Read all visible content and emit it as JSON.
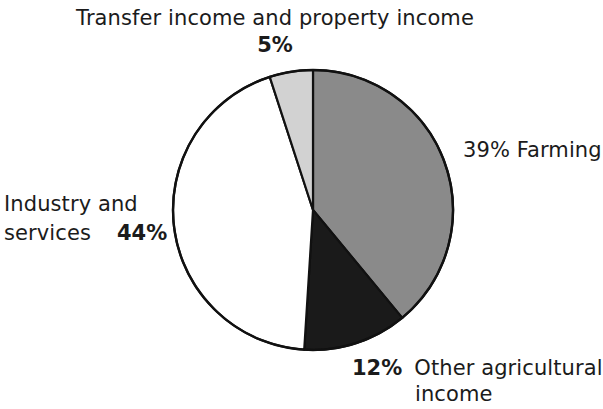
{
  "chart_data": {
    "type": "pie",
    "title": "",
    "categories": [
      "Farming",
      "Other agricultural income",
      "Industry and services",
      "Transfer income and property income"
    ],
    "values": [
      39,
      12,
      44,
      5
    ],
    "value_unit": "%",
    "legend": "none",
    "labels_position": "outside",
    "start_angle_deg": 0,
    "direction": "clockwise",
    "slices": [
      {
        "name": "Farming",
        "value": 39,
        "value_label": "39%",
        "label": "Farming",
        "full_label": "39% Farming",
        "color": "#8a8a8a",
        "start_deg": 0,
        "end_deg": 140.4
      },
      {
        "name": "Other agricultural income",
        "value": 12,
        "value_label": "12%",
        "label": "Other agricultural income",
        "full_label": "12% Other agricultural income",
        "color": "#1a1a1a",
        "start_deg": 140.4,
        "end_deg": 183.6
      },
      {
        "name": "Industry and services",
        "value": 44,
        "value_label": "44%",
        "label": "Industry and services",
        "full_label": "Industry and services 44%",
        "color": "#ffffff",
        "start_deg": 183.6,
        "end_deg": 342.0
      },
      {
        "name": "Transfer income and property income",
        "value": 5,
        "value_label": "5%",
        "label": "Transfer income and property income",
        "full_label": "Transfer income and property income 5%",
        "color": "#d2d2d2",
        "start_deg": 342.0,
        "end_deg": 360.0
      }
    ],
    "outline_color": "#111111"
  },
  "labels": {
    "transfer": {
      "text": "Transfer income and property income",
      "percent": "5%"
    },
    "farming": {
      "text": "39% Farming"
    },
    "industry": {
      "line1": "Industry and",
      "line2": "services",
      "percent": "44%"
    },
    "other": {
      "percent": "12%",
      "line1": "Other agricultural",
      "line2": "income"
    }
  }
}
